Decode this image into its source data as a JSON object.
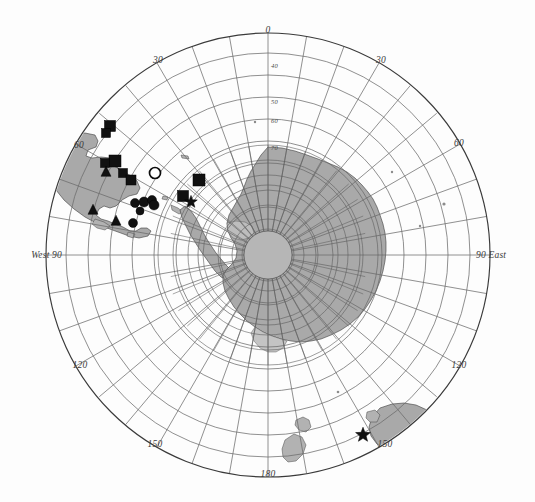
{
  "figure": {
    "type": "polar-stereographic-map",
    "region": "Antarctica and Southern Ocean",
    "projection_center": "South Pole",
    "background_color": "#fdfdfd",
    "land_fill_color": "#a9a9a9",
    "grid_color": "#6b6b6b",
    "marker_color": "#111111"
  },
  "meridian_labels": [
    {
      "id": "m000",
      "text": "0",
      "deg": 0,
      "x": 268,
      "y": 33
    },
    {
      "id": "m030e",
      "text": "30",
      "deg": 30,
      "x": 380,
      "y": 62
    },
    {
      "id": "m060e",
      "text": "60",
      "deg": 60,
      "x": 458,
      "y": 144
    },
    {
      "id": "m090e",
      "text": "90 East",
      "deg": 90,
      "x": 482,
      "y": 255
    },
    {
      "id": "m120e",
      "text": "120",
      "deg": 120,
      "x": 458,
      "y": 366
    },
    {
      "id": "m150e",
      "text": "150",
      "deg": 150,
      "x": 384,
      "y": 444
    },
    {
      "id": "m180",
      "text": "180",
      "deg": 180,
      "x": 268,
      "y": 474
    },
    {
      "id": "m150w",
      "text": "150",
      "deg": 210,
      "x": 157,
      "y": 444
    },
    {
      "id": "m120w",
      "text": "120",
      "deg": 240,
      "x": 80,
      "y": 366
    },
    {
      "id": "m090w",
      "text": "West 90",
      "deg": 270,
      "x": 28,
      "y": 255
    },
    {
      "id": "m060w",
      "text": "60",
      "deg": 300,
      "x": 78,
      "y": 146
    },
    {
      "id": "m030w",
      "text": "30",
      "deg": 330,
      "x": 158,
      "y": 62
    }
  ],
  "latitude_labels": [
    {
      "id": "lat40",
      "text": "40",
      "x": 269,
      "y": 66
    },
    {
      "id": "lat50",
      "text": "50",
      "x": 269,
      "y": 102
    },
    {
      "id": "lat60",
      "text": "60",
      "x": 269,
      "y": 121
    },
    {
      "id": "lat70",
      "text": "70",
      "x": 269,
      "y": 148
    }
  ],
  "grid": {
    "meridian_step_deg": 10,
    "parallel_count_outer": 9,
    "parallel_count_inner": 7,
    "outer_circle_radius_px": 222,
    "center_x": 268,
    "center_y": 255
  },
  "markers": {
    "legend_shapes": [
      "filled-square",
      "filled-circle",
      "filled-triangle",
      "open-circle",
      "filled-star"
    ],
    "points": [
      {
        "shape": "filled-square",
        "x": 110,
        "y": 126,
        "size": 11
      },
      {
        "shape": "filled-square",
        "x": 106,
        "y": 133,
        "size": 9
      },
      {
        "shape": "filled-square",
        "x": 115,
        "y": 161,
        "size": 12
      },
      {
        "shape": "filled-square",
        "x": 105,
        "y": 163,
        "size": 9
      },
      {
        "shape": "filled-triangle",
        "x": 106,
        "y": 172,
        "size": 10
      },
      {
        "shape": "filled-square",
        "x": 123,
        "y": 173,
        "size": 9
      },
      {
        "shape": "filled-square",
        "x": 131,
        "y": 180,
        "size": 10
      },
      {
        "shape": "open-circle",
        "x": 155,
        "y": 173,
        "size": 11
      },
      {
        "shape": "filled-circle",
        "x": 144,
        "y": 202,
        "size": 10
      },
      {
        "shape": "filled-circle",
        "x": 135,
        "y": 203,
        "size": 9
      },
      {
        "shape": "filled-circle",
        "x": 152,
        "y": 200,
        "size": 9
      },
      {
        "shape": "filled-circle",
        "x": 154,
        "y": 205,
        "size": 10
      },
      {
        "shape": "filled-circle",
        "x": 140,
        "y": 211,
        "size": 8
      },
      {
        "shape": "filled-circle",
        "x": 133,
        "y": 223,
        "size": 9
      },
      {
        "shape": "filled-triangle",
        "x": 93,
        "y": 210,
        "size": 10
      },
      {
        "shape": "filled-triangle",
        "x": 116,
        "y": 221,
        "size": 10
      },
      {
        "shape": "filled-square",
        "x": 199,
        "y": 180,
        "size": 12
      },
      {
        "shape": "filled-square",
        "x": 183,
        "y": 196,
        "size": 11
      },
      {
        "shape": "filled-star",
        "x": 191,
        "y": 202,
        "size": 11
      },
      {
        "shape": "filled-star",
        "x": 363,
        "y": 435,
        "size": 13
      }
    ]
  },
  "landmasses": [
    {
      "name": "south-america",
      "note": "upper-left gray continent"
    },
    {
      "name": "antarctica",
      "note": "central gray continent at pole"
    },
    {
      "name": "antarctic-peninsula",
      "note": "arc toward upper-left"
    },
    {
      "name": "australia",
      "note": "lower-right gray landmass"
    },
    {
      "name": "tasmania",
      "note": "small island near 150 E"
    },
    {
      "name": "new-zealand",
      "note": "lower-centre island pair"
    }
  ]
}
